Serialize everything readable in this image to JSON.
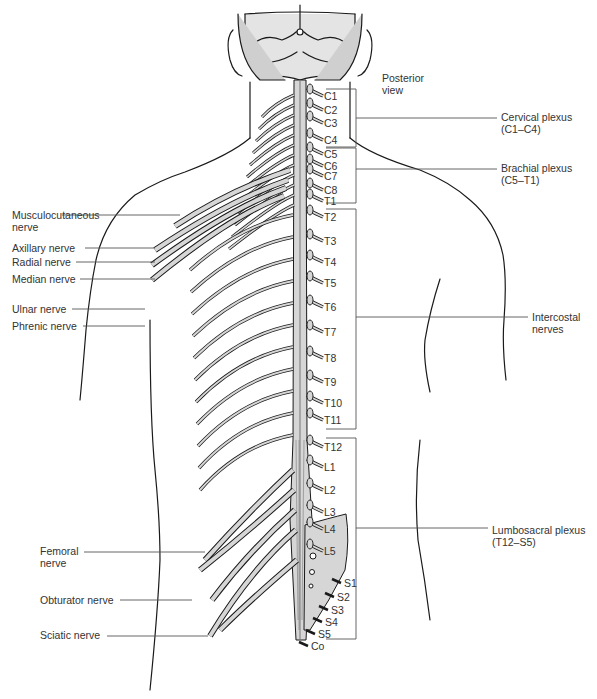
{
  "figure": {
    "view_label": [
      "Posterior",
      "view"
    ],
    "colors": {
      "nerve_fill": "#d6d6d6",
      "outline": "#1a1a1a",
      "leader": "#555555",
      "text": "#333333",
      "background": "#ffffff"
    }
  },
  "left_labels": [
    {
      "id": "musculocutaneous",
      "lines": [
        "Musculocutaneous",
        "nerve"
      ],
      "x": 12,
      "y": 209,
      "lineY": 215,
      "lineX1": 62,
      "lineX2": 180
    },
    {
      "id": "axillary",
      "lines": [
        "Axillary nerve"
      ],
      "x": 12,
      "y": 242,
      "lineY": 248,
      "lineX1": 85,
      "lineX2": 155
    },
    {
      "id": "radial",
      "lines": [
        "Radial nerve"
      ],
      "x": 12,
      "y": 256,
      "lineY": 262,
      "lineX1": 76,
      "lineX2": 155
    },
    {
      "id": "median",
      "lines": [
        "Median nerve"
      ],
      "x": 12,
      "y": 273,
      "lineY": 279,
      "lineX1": 80,
      "lineX2": 155
    },
    {
      "id": "ulnar",
      "lines": [
        "Ulnar nerve"
      ],
      "x": 12,
      "y": 303,
      "lineY": 309,
      "lineX1": 72,
      "lineX2": 145
    },
    {
      "id": "phrenic",
      "lines": [
        "Phrenic nerve"
      ],
      "x": 12,
      "y": 320,
      "lineY": 326,
      "lineX1": 83,
      "lineX2": 145
    },
    {
      "id": "femoral",
      "lines": [
        "Femoral",
        "nerve"
      ],
      "x": 40,
      "y": 545,
      "lineY": 552,
      "lineX1": 84,
      "lineX2": 205
    },
    {
      "id": "obturator",
      "lines": [
        "Obturator nerve"
      ],
      "x": 40,
      "y": 594,
      "lineY": 600,
      "lineX1": 120,
      "lineX2": 192
    },
    {
      "id": "sciatic",
      "lines": [
        "Sciatic nerve"
      ],
      "x": 40,
      "y": 629,
      "lineY": 636,
      "lineX1": 107,
      "lineX2": 208
    }
  ],
  "right_labels": [
    {
      "id": "cervical-plexus",
      "lines": [
        "Cervical plexus",
        "(C1–C4)"
      ],
      "x": 501,
      "y": 111,
      "lineY": 118,
      "bracketTop": 89,
      "bracketBottom": 147
    },
    {
      "id": "brachial-plexus",
      "lines": [
        "Brachial plexus",
        "(C5–T1)"
      ],
      "x": 501,
      "y": 162,
      "lineY": 169,
      "bracketTop": 148,
      "bracketBottom": 203
    },
    {
      "id": "intercostal-nerves",
      "lines": [
        "Intercostal",
        "nerves"
      ],
      "x": 532,
      "y": 311,
      "lineY": 317,
      "bracketTop": 209,
      "bracketBottom": 429
    },
    {
      "id": "lumbosacral-plexus",
      "lines": [
        "Lumbosacral plexus",
        "(T12–S5)"
      ],
      "x": 492,
      "y": 524,
      "lineY": 528,
      "bracketTop": 438,
      "bracketBottom": 639
    }
  ],
  "segments": [
    {
      "label": "C1",
      "x": 324,
      "y": 90
    },
    {
      "label": "C2",
      "x": 324,
      "y": 104
    },
    {
      "label": "C3",
      "x": 324,
      "y": 117
    },
    {
      "label": "C4",
      "x": 324,
      "y": 134
    },
    {
      "label": "C5",
      "x": 324,
      "y": 148
    },
    {
      "label": "C6",
      "x": 324,
      "y": 160
    },
    {
      "label": "C7",
      "x": 324,
      "y": 170
    },
    {
      "label": "C8",
      "x": 324,
      "y": 184
    },
    {
      "label": "T1",
      "x": 324,
      "y": 195
    },
    {
      "label": "T2",
      "x": 324,
      "y": 211
    },
    {
      "label": "T3",
      "x": 324,
      "y": 235
    },
    {
      "label": "T4",
      "x": 324,
      "y": 256
    },
    {
      "label": "T5",
      "x": 324,
      "y": 277
    },
    {
      "label": "T6",
      "x": 324,
      "y": 301
    },
    {
      "label": "T7",
      "x": 324,
      "y": 326
    },
    {
      "label": "T8",
      "x": 324,
      "y": 352
    },
    {
      "label": "T9",
      "x": 324,
      "y": 376
    },
    {
      "label": "T10",
      "x": 324,
      "y": 397
    },
    {
      "label": "T11",
      "x": 324,
      "y": 414
    },
    {
      "label": "T12",
      "x": 324,
      "y": 441
    },
    {
      "label": "L1",
      "x": 324,
      "y": 461
    },
    {
      "label": "L2",
      "x": 324,
      "y": 484
    },
    {
      "label": "L3",
      "x": 324,
      "y": 506
    },
    {
      "label": "L4",
      "x": 324,
      "y": 523
    },
    {
      "label": "L5",
      "x": 324,
      "y": 545
    },
    {
      "label": "S1",
      "x": 344,
      "y": 577
    },
    {
      "label": "S2",
      "x": 337,
      "y": 591
    },
    {
      "label": "S3",
      "x": 331,
      "y": 604
    },
    {
      "label": "S4",
      "x": 325,
      "y": 616
    },
    {
      "label": "S5",
      "x": 318,
      "y": 628
    },
    {
      "label": "Co",
      "x": 311,
      "y": 640
    }
  ]
}
